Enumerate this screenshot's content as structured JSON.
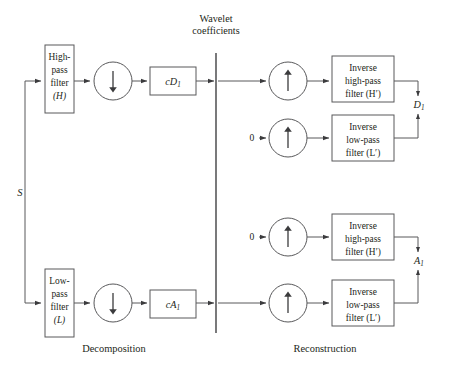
{
  "figure": {
    "title_top": "Wavelet",
    "title_top2": "coefficients",
    "input_signal": "S",
    "section_left": "Decomposition",
    "section_right": "Reconstruction"
  },
  "decomposition": {
    "highpass": {
      "line1": "High-",
      "line2": "pass",
      "line3": "filter",
      "line4": "(H)"
    },
    "lowpass": {
      "line1": "Low-",
      "line2": "pass",
      "line3": "filter",
      "line4": "(L)"
    },
    "downsample_icon_top": "downsample-arrow",
    "downsample_icon_bottom": "downsample-arrow",
    "coef_detail": "cD",
    "coef_detail_sub": "1",
    "coef_approx": "cA",
    "coef_approx_sub": "1"
  },
  "reconstruction": {
    "rows": [
      {
        "zero_input": "",
        "upsample_icon": "upsample-arrow",
        "filter_line1": "Inverse",
        "filter_line2": "high-pass",
        "filter_line3": "filter (H′)"
      },
      {
        "zero_input": "0",
        "upsample_icon": "upsample-arrow",
        "filter_line1": "Inverse",
        "filter_line2": "low-pass",
        "filter_line3": "filter (L′)"
      },
      {
        "zero_input": "0",
        "upsample_icon": "upsample-arrow",
        "filter_line1": "Inverse",
        "filter_line2": "high-pass",
        "filter_line3": "filter (H′)"
      },
      {
        "zero_input": "",
        "upsample_icon": "upsample-arrow",
        "filter_line1": "Inverse",
        "filter_line2": "low-pass",
        "filter_line3": "filter (L′)"
      }
    ],
    "output_detail": "D",
    "output_detail_sub": "1",
    "output_approx": "A",
    "output_approx_sub": "1"
  },
  "colors": {
    "stroke": "#58585a",
    "text": "#231f20",
    "background": "#ffffff"
  }
}
